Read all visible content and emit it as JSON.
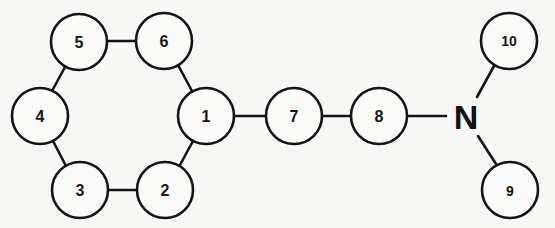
{
  "diagram": {
    "type": "molecular-graph",
    "colors": {
      "background": "#f7f7f5",
      "stroke": "#141414",
      "text": "#161616"
    },
    "node_radius": 28,
    "nodes": [
      {
        "id": "1",
        "label": "1",
        "x": 206,
        "y": 116
      },
      {
        "id": "2",
        "label": "2",
        "x": 165,
        "y": 190
      },
      {
        "id": "3",
        "label": "3",
        "x": 80,
        "y": 190
      },
      {
        "id": "4",
        "label": "4",
        "x": 40,
        "y": 116
      },
      {
        "id": "5",
        "label": "5",
        "x": 79,
        "y": 42
      },
      {
        "id": "6",
        "label": "6",
        "x": 164,
        "y": 41
      },
      {
        "id": "7",
        "label": "7",
        "x": 294,
        "y": 116
      },
      {
        "id": "8",
        "label": "8",
        "x": 379,
        "y": 116
      },
      {
        "id": "9",
        "label": "9",
        "x": 510,
        "y": 190
      },
      {
        "id": "10",
        "label": "10",
        "x": 509,
        "y": 41
      }
    ],
    "atom": {
      "id": "N",
      "label": "N",
      "x": 467,
      "y": 117
    },
    "edges": [
      [
        "1",
        "2"
      ],
      [
        "2",
        "3"
      ],
      [
        "3",
        "4"
      ],
      [
        "4",
        "5"
      ],
      [
        "5",
        "6"
      ],
      [
        "6",
        "1"
      ],
      [
        "1",
        "7"
      ],
      [
        "7",
        "8"
      ],
      [
        "8",
        "N"
      ],
      [
        "N",
        "10"
      ],
      [
        "N",
        "9"
      ]
    ]
  }
}
